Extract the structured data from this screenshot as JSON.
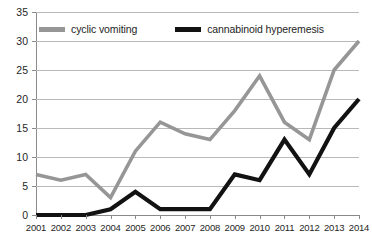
{
  "chart_data": {
    "type": "line",
    "title": "",
    "xlabel": "",
    "ylabel": "",
    "categories": [
      "2001",
      "2002",
      "2003",
      "2004",
      "2005",
      "2006",
      "2007",
      "2008",
      "2009",
      "2010",
      "2011",
      "2012",
      "2013",
      "2014"
    ],
    "ylim": [
      0,
      35
    ],
    "ytick_labels": [
      "0",
      "5",
      "10",
      "15",
      "20",
      "25",
      "30",
      "35"
    ],
    "ytick_values": [
      0,
      5,
      10,
      15,
      20,
      25,
      30,
      35
    ],
    "grid": true,
    "legend_position": "top-center",
    "series": [
      {
        "name": "cyclic vomiting",
        "color": "#969696",
        "values": [
          7,
          6,
          7,
          3,
          11,
          16,
          14,
          13,
          18,
          24,
          16,
          13,
          25,
          30
        ]
      },
      {
        "name": "cannabinoid hyperemesis",
        "color": "#121212",
        "values": [
          0,
          0,
          0,
          1,
          4,
          1,
          1,
          1,
          7,
          6,
          13,
          7,
          15,
          20
        ]
      }
    ]
  },
  "legend": {
    "entries": [
      {
        "label": "cyclic vomiting",
        "color": "#969696"
      },
      {
        "label": "cannabinoid hyperemesis",
        "color": "#121212"
      }
    ]
  },
  "colors": {
    "cyclic_vomiting": "#969696",
    "cannabinoid_hyperemesis": "#121212",
    "gridline": "#b9b9b9",
    "axis": "#8a8a8a",
    "background": "#ffffff",
    "text": "#1f1f1f"
  }
}
